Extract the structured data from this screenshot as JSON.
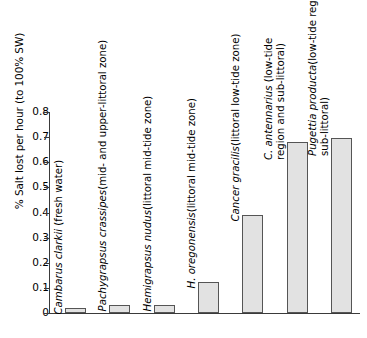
{
  "chart_data": {
    "type": "bar",
    "title": "",
    "xlabel": "",
    "ylabel": "% Salt lost per hour (to 100% SW)",
    "ylim": [
      0,
      0.8
    ],
    "ytick_labels": [
      "0.8",
      "0.7",
      "0.6",
      "0.5",
      "0.4",
      "0.3",
      "0.2",
      "0.1",
      "0"
    ],
    "ytick_values": [
      0.8,
      0.7,
      0.6,
      0.5,
      0.4,
      0.3,
      0.2,
      0.1,
      0
    ],
    "grid": false,
    "legend": "none",
    "categories": [
      "Cambarus clarkii (fresh water)",
      "Pachygrapsus crassipes (mid- and upper-littoral zone)",
      "Hemigrapsus nudus (littoral mid-tide zone)",
      "H. oregonensis (littoral mid-tide zone)",
      "Cancer gracilis (littoral low-tide zone)",
      "C. antennarius (low-tide region and sub-littoral)",
      "Pugettia producta (low-tide region and sub-littoral)"
    ],
    "values": [
      0.018,
      0.032,
      0.032,
      0.125,
      0.39,
      0.68,
      0.695
    ],
    "bars": [
      {
        "species": "Cambarus clarkii",
        "habitat_lines": [
          " (fresh water)"
        ],
        "value": 0.018
      },
      {
        "species": "Pachygrapsus crassipes",
        "habitat_lines": [
          "(mid- and upper-littoral zone)"
        ],
        "value": 0.032
      },
      {
        "species": "Hemigrapsus nudus",
        "habitat_lines": [
          "(littoral mid-tide zone)"
        ],
        "value": 0.032
      },
      {
        "species": "H. oregonensis",
        "habitat_lines": [
          "(littoral mid-tide zone)"
        ],
        "value": 0.125
      },
      {
        "species": "Cancer gracilis",
        "habitat_lines": [
          "(littoral low-tide zone)"
        ],
        "value": 0.39
      },
      {
        "species": "C. antennarius",
        "habitat_lines": [
          " (low-tide",
          "region and sub-littoral)"
        ],
        "value": 0.68
      },
      {
        "species": "Pugettia producta",
        "habitat_lines": [
          "(low-tide region and",
          "sub-littoral)"
        ],
        "value": 0.695
      }
    ],
    "colors": {
      "bar_fill": "#e2e2e2",
      "bar_border": "#555555",
      "axis": "#3a3a3a",
      "text": "#000000",
      "background": "#ffffff"
    }
  }
}
